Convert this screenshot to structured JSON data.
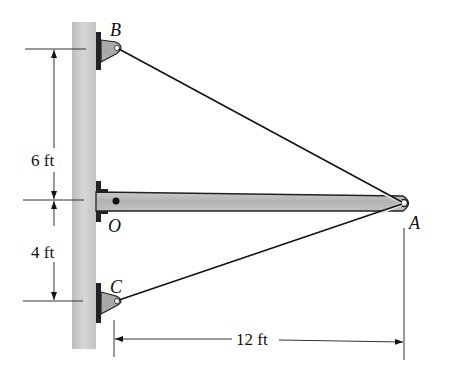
{
  "figure": {
    "points": {
      "B": "B",
      "O": "O",
      "A": "A",
      "C": "C"
    },
    "dimensions": {
      "upper": "6 ft",
      "lower": "4 ft",
      "horizontal": "12 ft"
    },
    "colors": {
      "pole": "#c8c8c8",
      "boom": "#bdbdbd",
      "bracket": "#a9a9a9",
      "line": "#111111"
    }
  }
}
